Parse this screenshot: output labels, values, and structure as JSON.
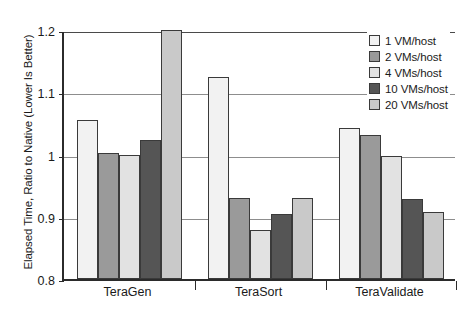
{
  "chart_data": {
    "type": "bar",
    "title": "",
    "xlabel": "",
    "ylabel": "Elapsed Time, Ratio to Native (Lower Is Better)",
    "categories": [
      "TeraGen",
      "TeraSort",
      "TeraValidate"
    ],
    "ylim": [
      0.8,
      1.2
    ],
    "yticks": [
      "0.8",
      "0.9",
      "1",
      "1.1",
      "1.2"
    ],
    "ytick_values": [
      0.8,
      0.9,
      1.0,
      1.1,
      1.2
    ],
    "grid": true,
    "legend_position": "top-right",
    "series": [
      {
        "name": "1 VM/host",
        "color": "#f2f2f2",
        "values": [
          1.055,
          1.125,
          1.042
        ]
      },
      {
        "name": "2 VMs/host",
        "color": "#9a9a9a",
        "values": [
          1.002,
          0.93,
          1.032
        ]
      },
      {
        "name": "4 VMs/host",
        "color": "#e2e2e2",
        "values": [
          1.0,
          0.878,
          0.997
        ]
      },
      {
        "name": "10 VMs/host",
        "color": "#555555",
        "values": [
          1.023,
          0.905,
          0.928
        ]
      },
      {
        "name": "20 VMs/host",
        "color": "#c9c9c9",
        "values": [
          1.2,
          0.93,
          0.908
        ]
      }
    ]
  },
  "axis": {
    "y_title": "Elapsed Time, Ratio to Native (Lower Is Better)"
  },
  "legend": {
    "items": [
      {
        "label": "1 VM/host",
        "color": "#f2f2f2"
      },
      {
        "label": "2 VMs/host",
        "color": "#9a9a9a"
      },
      {
        "label": "4 VMs/host",
        "color": "#e2e2e2"
      },
      {
        "label": "10 VMs/host",
        "color": "#555555"
      },
      {
        "label": "20 VMs/host",
        "color": "#c9c9c9"
      }
    ]
  }
}
